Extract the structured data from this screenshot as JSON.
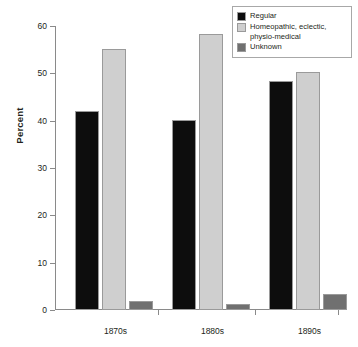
{
  "chart_data": {
    "type": "bar",
    "title": "",
    "subtitle": "",
    "xlabel": "",
    "ylabel": "Percent",
    "categories": [
      "1870s",
      "1880s",
      "1890s"
    ],
    "series": [
      {
        "name": "Regular",
        "color": "#0d0d0d",
        "values": [
          42.0,
          40.2,
          48.4
        ]
      },
      {
        "name": "Homeopathic, eclectic, physio-medical",
        "color": "#cfcfcf",
        "values": [
          55.2,
          58.4,
          50.3
        ]
      },
      {
        "name": "Unknown",
        "color": "#707070",
        "values": [
          2.0,
          1.2,
          3.4
        ]
      }
    ],
    "ylim": [
      0,
      60
    ],
    "yticks": [
      0,
      10,
      20,
      30,
      40,
      50,
      60
    ],
    "ytick_labels": [
      "0",
      "10",
      "20",
      "30",
      "40",
      "50",
      "60"
    ],
    "grid": false,
    "legend_position": "top-right"
  },
  "legend": {
    "entries": [
      {
        "label": "Regular",
        "label_line2": ""
      },
      {
        "label": "Homeopathic, eclectic,",
        "label_line2": "physio-medical"
      },
      {
        "label": "Unknown",
        "label_line2": ""
      }
    ]
  },
  "colors": {
    "regular": "#0d0d0d",
    "homeopathic": "#cfcfcf",
    "unknown": "#707070",
    "axis": "#8a8a8a",
    "text": "#231f20",
    "bar_border": "#9a9a9a",
    "background": "#ffffff"
  }
}
